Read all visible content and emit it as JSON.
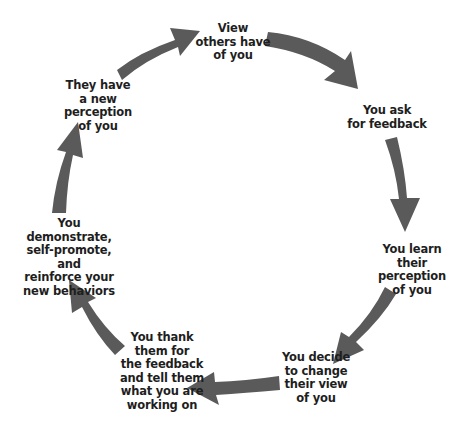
{
  "diagram": {
    "type": "cycle",
    "arrow_color": "#5a5a5a",
    "steps": [
      {
        "id": 1,
        "label": "View\nothers have\nof you"
      },
      {
        "id": 2,
        "label": "You ask\nfor feedback"
      },
      {
        "id": 3,
        "label": "You learn\ntheir perception\nof you"
      },
      {
        "id": 4,
        "label": "You decide\nto change\ntheir view\nof you"
      },
      {
        "id": 5,
        "label": "You thank\nthem for\nthe feedback\nand tell them\nwhat you are\nworking on"
      },
      {
        "id": 6,
        "label": "You demonstrate,\nself-promote, and\nreinforce your\nnew behaviors"
      },
      {
        "id": 7,
        "label": "They have\na new perception\nof you"
      }
    ],
    "arrows": [
      {
        "from": 7,
        "to": 1
      },
      {
        "from": 1,
        "to": 2
      },
      {
        "from": 2,
        "to": 3
      },
      {
        "from": 3,
        "to": 4
      },
      {
        "from": 4,
        "to": 5
      },
      {
        "from": 5,
        "to": 6
      },
      {
        "from": 6,
        "to": 7
      }
    ]
  }
}
